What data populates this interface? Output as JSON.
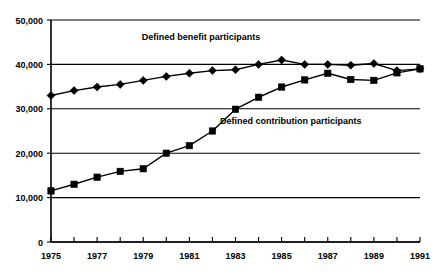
{
  "chart_data": {
    "type": "line",
    "title": "",
    "xlabel": "",
    "ylabel": "",
    "grid": true,
    "legend_position": "inline-annotations",
    "xlim": [
      1975,
      1991
    ],
    "ylim": [
      0,
      50000
    ],
    "x": [
      1975,
      1976,
      1977,
      1978,
      1979,
      1980,
      1981,
      1982,
      1983,
      1984,
      1985,
      1986,
      1987,
      1988,
      1989,
      1990,
      1991
    ],
    "xtick_labels": [
      "1975",
      "1977",
      "1979",
      "1981",
      "1983",
      "1985",
      "1987",
      "1989",
      "1991"
    ],
    "xtick_values": [
      1975,
      1977,
      1979,
      1981,
      1983,
      1985,
      1987,
      1989,
      1991
    ],
    "ytick_labels": [
      "0",
      "10,000",
      "20,000",
      "30,000",
      "40,000",
      "50,000"
    ],
    "ytick_values": [
      0,
      10000,
      20000,
      30000,
      40000,
      50000
    ],
    "series": [
      {
        "name": "Defined benefit participants",
        "marker": "diamond",
        "color": "#000000",
        "values": [
          33004,
          34100,
          34900,
          35500,
          36400,
          37300,
          38000,
          38600,
          38800,
          40000,
          41000,
          40000,
          40000,
          39800,
          40200,
          38600,
          39000
        ]
      },
      {
        "name": "Defined contribution participants",
        "marker": "square",
        "color": "#000000",
        "values": [
          11507,
          13000,
          14600,
          15900,
          16500,
          20000,
          21700,
          25000,
          29900,
          32600,
          34900,
          36500,
          38000,
          36600,
          36400,
          38100,
          39000
        ]
      }
    ],
    "annotations": [
      {
        "text": "Defined benefit participants",
        "x": 1981.5,
        "y": 45500
      },
      {
        "text": "Defined contribution participants",
        "x": 1985.4,
        "y": 26500
      }
    ]
  }
}
